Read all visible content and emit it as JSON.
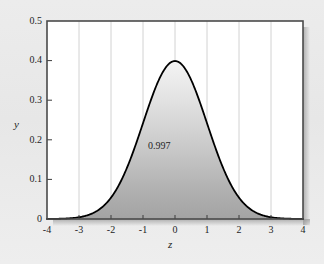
{
  "chart_data": {
    "type": "area",
    "title": "",
    "subtitle": "",
    "xlabel": "z",
    "ylabel": "y",
    "xlim": [
      -4,
      4
    ],
    "ylim": [
      0,
      0.5
    ],
    "grid": "vertical",
    "legend": "none",
    "curve": {
      "name": "standard normal density",
      "formula": "phi(z) = exp(-z^2/2) / sqrt(2*pi)",
      "peak_x": 0,
      "peak_y": 0.399,
      "mean": 0,
      "sd": 1
    },
    "shaded_region": {
      "from": -3,
      "to": 3,
      "area": 0.997,
      "label": "0.997"
    },
    "xticks": [
      -4,
      -3,
      -2,
      -1,
      0,
      1,
      2,
      3,
      4
    ],
    "xtick_labels": [
      "-4",
      "-3",
      "-2",
      "-1",
      "0",
      "1",
      "2",
      "3",
      "4"
    ],
    "yticks": [
      0,
      0.1,
      0.2,
      0.3,
      0.4,
      0.5
    ],
    "ytick_labels": [
      "0",
      "0.1",
      "0.2",
      "0.3",
      "0.4",
      "0.5"
    ],
    "series": [
      {
        "name": "standard normal density",
        "x": [
          -4,
          -3.75,
          -3.5,
          -3.25,
          -3,
          -2.75,
          -2.5,
          -2.25,
          -2,
          -1.75,
          -1.5,
          -1.25,
          -1,
          -0.75,
          -0.5,
          -0.25,
          0,
          0.25,
          0.5,
          0.75,
          1,
          1.25,
          1.5,
          1.75,
          2,
          2.25,
          2.5,
          2.75,
          3,
          3.25,
          3.5,
          3.75,
          4
        ],
        "values": [
          0.0001,
          0.0004,
          0.0009,
          0.002,
          0.0044,
          0.0091,
          0.0175,
          0.0317,
          0.054,
          0.0863,
          0.1295,
          0.1826,
          0.242,
          0.3011,
          0.3521,
          0.3867,
          0.3989,
          0.3867,
          0.3521,
          0.3011,
          0.242,
          0.1826,
          0.1295,
          0.0863,
          0.054,
          0.0317,
          0.0175,
          0.0091,
          0.0044,
          0.002,
          0.0009,
          0.0004,
          0.0001
        ]
      }
    ]
  },
  "colors": {
    "page_background": "#eaeaea",
    "plot_background": "#ffffff",
    "curve": "#000000",
    "fill_top": "#f2f2f2",
    "fill_bottom": "#a5a5a5",
    "gridline": "#d2d2d2",
    "frame": "#4a4a4a",
    "text": "#1d1d1d"
  }
}
